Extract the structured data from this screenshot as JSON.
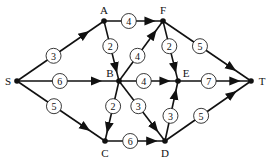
{
  "diagram": {
    "type": "directed-weighted-network",
    "nodes": [
      {
        "id": "S",
        "label": "S",
        "x": 17,
        "y": 81,
        "lx": 8,
        "ly": 81
      },
      {
        "id": "A",
        "label": "A",
        "x": 104,
        "y": 21,
        "lx": 104,
        "ly": 10
      },
      {
        "id": "F",
        "label": "F",
        "x": 163,
        "y": 21,
        "lx": 163,
        "ly": 10
      },
      {
        "id": "B",
        "label": "B",
        "x": 119,
        "y": 81,
        "lx": 110,
        "ly": 73
      },
      {
        "id": "E",
        "label": "E",
        "x": 178,
        "y": 81,
        "lx": 186,
        "ly": 73
      },
      {
        "id": "T",
        "label": "T",
        "x": 251,
        "y": 81,
        "lx": 262,
        "ly": 81
      },
      {
        "id": "C",
        "label": "C",
        "x": 105,
        "y": 141,
        "lx": 105,
        "ly": 153
      },
      {
        "id": "D",
        "label": "D",
        "x": 165,
        "y": 141,
        "lx": 165,
        "ly": 153
      }
    ],
    "edges": [
      {
        "from": "S",
        "to": "A",
        "weight": "3"
      },
      {
        "from": "S",
        "to": "B",
        "weight": "6"
      },
      {
        "from": "S",
        "to": "C",
        "weight": "5"
      },
      {
        "from": "A",
        "to": "F",
        "weight": "4"
      },
      {
        "from": "A",
        "to": "B",
        "weight": "2"
      },
      {
        "from": "B",
        "to": "F",
        "weight": "4"
      },
      {
        "from": "B",
        "to": "E",
        "weight": "4"
      },
      {
        "from": "B",
        "to": "C",
        "weight": "2"
      },
      {
        "from": "B",
        "to": "D",
        "weight": "3"
      },
      {
        "from": "F",
        "to": "E",
        "weight": "2"
      },
      {
        "from": "F",
        "to": "T",
        "weight": "5"
      },
      {
        "from": "E",
        "to": "T",
        "weight": "7"
      },
      {
        "from": "D",
        "to": "E",
        "weight": "3"
      },
      {
        "from": "D",
        "to": "T",
        "weight": "5"
      },
      {
        "from": "C",
        "to": "D",
        "weight": "6"
      }
    ]
  }
}
